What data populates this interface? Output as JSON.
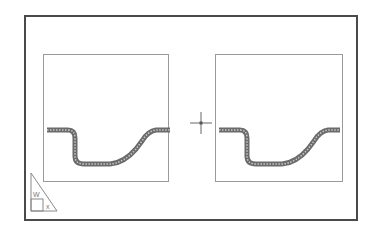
{
  "app": {
    "mode": "paper-space-layout"
  },
  "sheet": {
    "border_color": "#4a4a4a",
    "background": "#ffffff"
  },
  "viewports": [
    {
      "id": "left",
      "border_color": "#9a9a9a",
      "content": "curved-tube-profile"
    },
    {
      "id": "right",
      "border_color": "#9a9a9a",
      "content": "curved-tube-profile"
    }
  ],
  "geometry": {
    "stroke_color": "#6b6b6b",
    "stroke_inner": "#bdbdbd"
  },
  "cursor": {
    "type": "crosshair-pickbox"
  },
  "ucs_icon": {
    "type": "paper-space-triangle",
    "y_label": "W",
    "x_label": "x"
  }
}
